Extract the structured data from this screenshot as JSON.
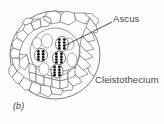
{
  "figure": {
    "panel_label": "(b)",
    "kind": "biology-line-drawing",
    "background_color": "#fdfdfc",
    "ink_color": "#6b6b70",
    "text_color": "#444447"
  },
  "labels": [
    {
      "id": "ascus",
      "text": "Ascus",
      "x": 113,
      "y": 13,
      "leader": {
        "from_x": 112,
        "from_y": 22,
        "to_x": 64,
        "to_y": 46
      }
    },
    {
      "id": "cleistothecium",
      "text": "Cleistothecium",
      "x": 95,
      "y": 74,
      "leader": {
        "from_x": 94,
        "from_y": 76,
        "to_x": 88,
        "to_y": 72
      }
    }
  ],
  "structure": {
    "outer_wall": {
      "cx": 55,
      "cy": 55,
      "rx": 45,
      "ry": 44
    },
    "inner_cavity": {
      "cx": 55,
      "cy": 52,
      "rx": 25,
      "ry": 24
    },
    "peridium_cell_count": 34,
    "asci": [
      {
        "cx": 62,
        "cy": 44,
        "rx": 6.5,
        "ry": 7.5,
        "spores": 8
      },
      {
        "cx": 41,
        "cy": 55,
        "rx": 6.5,
        "ry": 6.5,
        "spores": 8
      },
      {
        "cx": 59,
        "cy": 58,
        "rx": 6.5,
        "ry": 7.0,
        "spores": 8
      },
      {
        "cx": 57,
        "cy": 71,
        "rx": 6.0,
        "ry": 7.0,
        "spores": 8
      }
    ],
    "empty_vesicles": [
      {
        "cx": 47,
        "cy": 41,
        "rx": 5.5,
        "ry": 7.0
      },
      {
        "cx": 44,
        "cy": 69,
        "rx": 5.0,
        "ry": 6.5
      },
      {
        "cx": 72,
        "cy": 60,
        "rx": 5.0,
        "ry": 7.0
      }
    ]
  }
}
